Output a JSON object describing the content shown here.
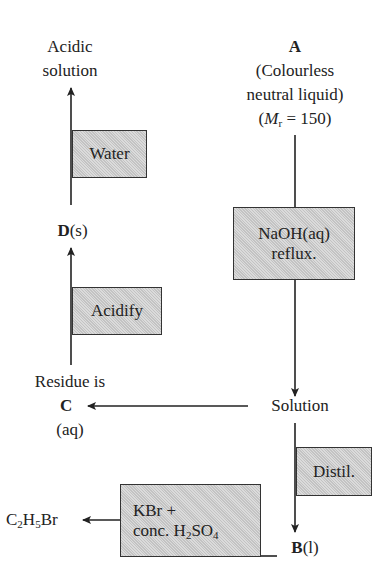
{
  "diagram": {
    "type": "reaction-scheme",
    "start": {
      "letter": "A",
      "line1": "(Colourless",
      "line2": "neutral liquid)",
      "mr_prefix": "(",
      "mr_symbol": "M",
      "mr_sub": "r",
      "mr_suffix": " = 150)"
    },
    "steps": {
      "naoh": {
        "line1": "NaOH(aq)",
        "line2": "reflux."
      },
      "distil": {
        "label": "Distil."
      },
      "kbr": {
        "line1": "KBr +",
        "line2_prefix": "conc. H",
        "line2_sub1": "2",
        "line2_mid": "SO",
        "line2_sub2": "4"
      },
      "acidify": {
        "label": "Acidify"
      },
      "water": {
        "label": "Water"
      }
    },
    "nodes": {
      "solution": "Solution",
      "b": {
        "letter": "B",
        "state": "(l)"
      },
      "c": {
        "pre": "Residue is",
        "letter": "C",
        "state": "(aq)"
      },
      "d": {
        "letter": "D",
        "state": "(s)"
      },
      "acidic": {
        "line1": "Acidic",
        "line2": "solution"
      },
      "ethyl_bromide": {
        "p1": "C",
        "s1": "2",
        "p2": "H",
        "s2": "5",
        "p3": "Br"
      }
    }
  }
}
